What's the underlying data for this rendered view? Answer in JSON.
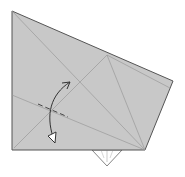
{
  "diagram": {
    "type": "origami-fold-step",
    "paper_color": "#c8c8c8",
    "line_color": "#888888",
    "edge_color": "#555555",
    "flap_color": "#ffffff",
    "fold_type": "valley-fold",
    "arrow": "curved-fold-arrow",
    "labels": []
  }
}
